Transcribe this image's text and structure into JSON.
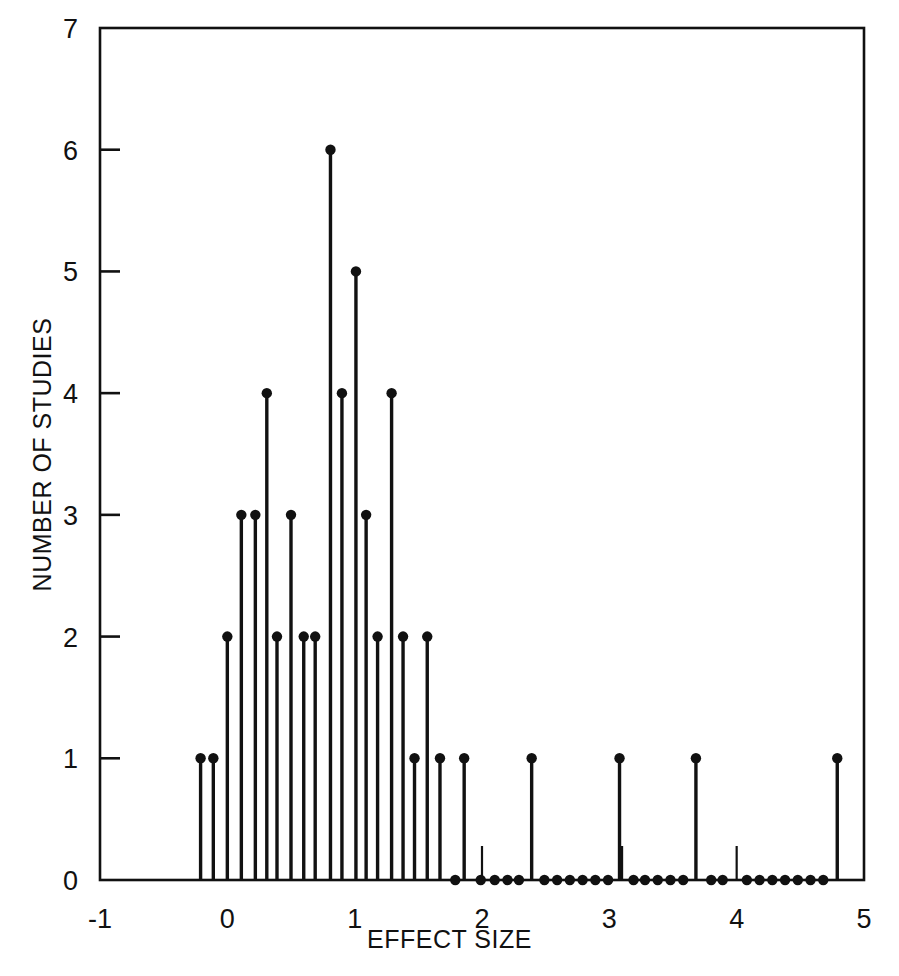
{
  "chart_data": {
    "type": "scatter",
    "title": "",
    "xlabel": "EFFECT SIZE",
    "ylabel": "NUMBER OF STUDIES",
    "xlim": [
      -1,
      5
    ],
    "ylim": [
      0,
      7
    ],
    "xticks": [
      -1,
      0,
      1,
      2,
      3,
      4,
      5
    ],
    "xticklabels": [
      "-1",
      "0",
      "1",
      "2",
      "3",
      "4",
      "5"
    ],
    "yticks": [
      0,
      1,
      2,
      3,
      4,
      5,
      6,
      7
    ],
    "yticklabels": [
      "0",
      "1",
      "2",
      "3",
      "4",
      "5",
      "6",
      "7"
    ],
    "grid": false,
    "legend": null,
    "marker": "filled-circle",
    "stems": true,
    "points": [
      {
        "x": -0.21,
        "y": 1
      },
      {
        "x": -0.11,
        "y": 1
      },
      {
        "x": 0.0,
        "y": 2
      },
      {
        "x": 0.11,
        "y": 3
      },
      {
        "x": 0.22,
        "y": 3
      },
      {
        "x": 0.31,
        "y": 4
      },
      {
        "x": 0.39,
        "y": 2
      },
      {
        "x": 0.5,
        "y": 3
      },
      {
        "x": 0.6,
        "y": 2
      },
      {
        "x": 0.69,
        "y": 2
      },
      {
        "x": 0.81,
        "y": 6
      },
      {
        "x": 0.9,
        "y": 4
      },
      {
        "x": 1.01,
        "y": 5
      },
      {
        "x": 1.09,
        "y": 3
      },
      {
        "x": 1.18,
        "y": 2
      },
      {
        "x": 1.29,
        "y": 4
      },
      {
        "x": 1.38,
        "y": 2
      },
      {
        "x": 1.47,
        "y": 1
      },
      {
        "x": 1.57,
        "y": 2
      },
      {
        "x": 1.67,
        "y": 1
      },
      {
        "x": 1.79,
        "y": 0
      },
      {
        "x": 1.86,
        "y": 1
      },
      {
        "x": 1.99,
        "y": 0
      },
      {
        "x": 2.1,
        "y": 0
      },
      {
        "x": 2.2,
        "y": 0
      },
      {
        "x": 2.29,
        "y": 0
      },
      {
        "x": 2.39,
        "y": 1
      },
      {
        "x": 2.49,
        "y": 0
      },
      {
        "x": 2.59,
        "y": 0
      },
      {
        "x": 2.69,
        "y": 0
      },
      {
        "x": 2.79,
        "y": 0
      },
      {
        "x": 2.89,
        "y": 0
      },
      {
        "x": 2.99,
        "y": 0
      },
      {
        "x": 3.08,
        "y": 1
      },
      {
        "x": 3.19,
        "y": 0
      },
      {
        "x": 3.28,
        "y": 0
      },
      {
        "x": 3.38,
        "y": 0
      },
      {
        "x": 3.48,
        "y": 0
      },
      {
        "x": 3.58,
        "y": 0
      },
      {
        "x": 3.68,
        "y": 1
      },
      {
        "x": 3.8,
        "y": 0
      },
      {
        "x": 3.89,
        "y": 0
      },
      {
        "x": 4.08,
        "y": 0
      },
      {
        "x": 4.18,
        "y": 0
      },
      {
        "x": 4.28,
        "y": 0
      },
      {
        "x": 4.38,
        "y": 0
      },
      {
        "x": 4.48,
        "y": 0
      },
      {
        "x": 4.58,
        "y": 0
      },
      {
        "x": 4.68,
        "y": 0
      },
      {
        "x": 4.79,
        "y": 1
      }
    ],
    "minor_xticks_inside": [
      2.0,
      3.1,
      4.0
    ]
  },
  "axes": {
    "x_axis_label": "EFFECT SIZE",
    "y_axis_label": "NUMBER OF STUDIES"
  },
  "colors": {
    "ink": "#111111",
    "background": "#ffffff"
  }
}
